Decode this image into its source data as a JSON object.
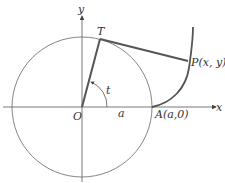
{
  "diagram": {
    "type": "involute of a circle",
    "labels": {
      "x_axis": "x",
      "y_axis": "y",
      "origin": "O",
      "tangent_point": "T",
      "point_p": "P(x, y)",
      "point_p_letter": "P",
      "point_p_coords": "(x, y)",
      "point_a": "A(a,0)",
      "point_a_letter": "A",
      "point_a_coords": "(a,0)",
      "radius": "a",
      "angle": "t"
    },
    "colors": {
      "stroke": "#555555",
      "thick_stroke": "#555555",
      "text": "#333333",
      "background": "#ffffff"
    }
  }
}
